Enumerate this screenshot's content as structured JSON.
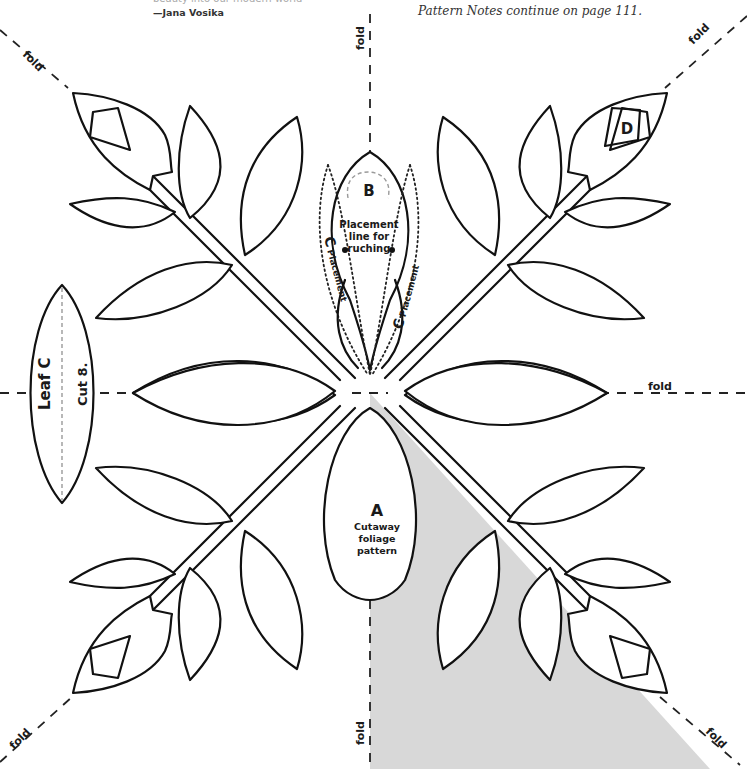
{
  "header": {
    "quote_fragment": "beauty into our modern world",
    "attribution": "—Jana Vosika",
    "continued_note": "Pattern Notes continue on page 111."
  },
  "fold_labels": {
    "top_left": "fold",
    "top_center": "fold",
    "top_right": "fold",
    "right_center": "fold",
    "bottom_left": "fold",
    "bottom_center": "fold",
    "bottom_right": "fold"
  },
  "pieces": {
    "a": {
      "letter": "A",
      "line1": "Cutaway",
      "line2": "foliage",
      "line3": "pattern"
    },
    "b": {
      "letter": "B",
      "line1": "Placement",
      "line2": "line for",
      "line3": "ruching"
    },
    "c_left": {
      "letter": "C",
      "word": "Placement"
    },
    "c_right": {
      "letter": "C",
      "word": "Placement"
    },
    "d": {
      "letter": "D"
    },
    "leaf_c": {
      "title": "Leaf C",
      "instruction": "Cut 8."
    }
  },
  "colors": {
    "shaded_section": "#d8d8d8",
    "outline": "#111111"
  }
}
